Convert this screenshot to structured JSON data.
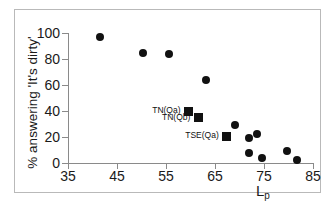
{
  "chart_data": {
    "type": "scatter",
    "title": "",
    "xlabel": "Lp",
    "xlabel_base": "L",
    "xlabel_sub": "p",
    "ylabel": "% answering 'It's dirty'",
    "xlim": [
      35,
      85
    ],
    "ylim": [
      0,
      100
    ],
    "xticks": [
      35,
      45,
      55,
      65,
      75,
      85
    ],
    "yticks": [
      0,
      20,
      40,
      60,
      80,
      100
    ],
    "grid": false,
    "legend": "none",
    "marker_color": "#111111",
    "axis_color": "#8a8a8a",
    "series": [
      {
        "name": "survey-points",
        "marker": "circle",
        "points": [
          {
            "x": 41.6,
            "y": 97
          },
          {
            "x": 50.4,
            "y": 85
          },
          {
            "x": 55.7,
            "y": 84
          },
          {
            "x": 63.1,
            "y": 64
          },
          {
            "x": 69.0,
            "y": 29
          },
          {
            "x": 71.9,
            "y": 19
          },
          {
            "x": 73.5,
            "y": 22
          },
          {
            "x": 72.0,
            "y": 8
          },
          {
            "x": 74.6,
            "y": 4
          },
          {
            "x": 79.7,
            "y": 9
          },
          {
            "x": 81.7,
            "y": 2
          }
        ]
      },
      {
        "name": "labelled-points",
        "marker": "square",
        "points": [
          {
            "x": 59.6,
            "y": 40,
            "label": "TN(Qa)"
          },
          {
            "x": 61.6,
            "y": 35,
            "label": "TN(Qb)"
          },
          {
            "x": 67.4,
            "y": 20.5,
            "label": "TSE(Qa)"
          }
        ]
      }
    ],
    "annotations": [
      {
        "text": "TN(Qa)",
        "x": 59.6,
        "y": 40
      },
      {
        "text": "TN(Qb)",
        "x": 61.6,
        "y": 35
      },
      {
        "text": "TSE(Qa)",
        "x": 67.4,
        "y": 20.5
      }
    ]
  }
}
